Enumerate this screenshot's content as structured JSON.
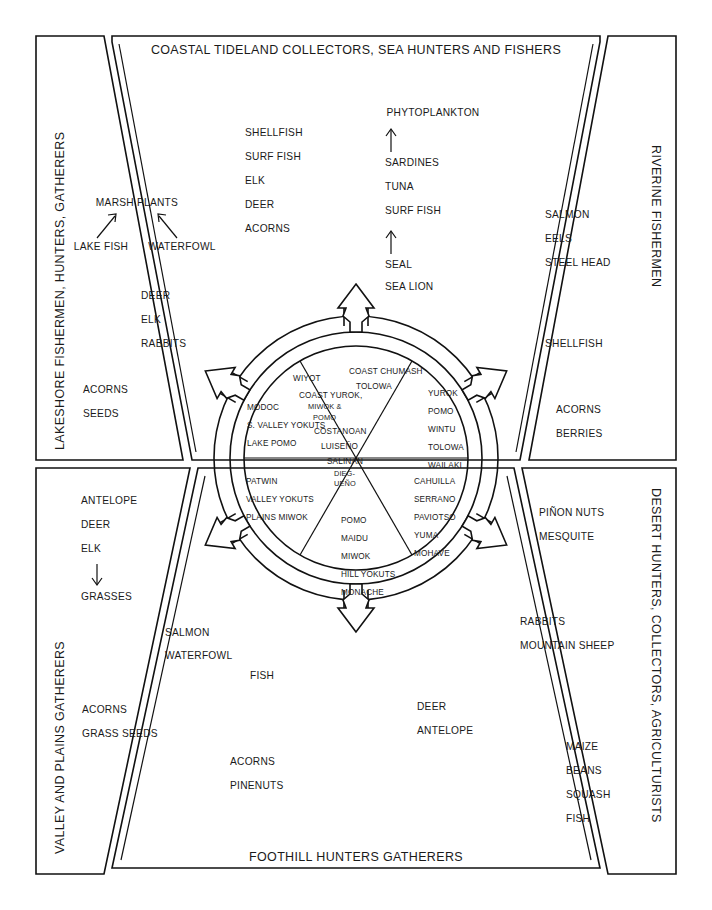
{
  "figure": {
    "ghost_top": "  ",
    "title_top": "COASTAL TIDELAND COLLECTORS, SEA HUNTERS AND  FISHERS",
    "title_bottom": "FOOTHILL HUNTERS  GATHERERS",
    "title_left_top": "LAKESHORE FISHERMEN, HUNTERS, GATHERERS",
    "title_right_top": "RIVERINE FISHERMEN",
    "title_left_bottom": "VALLEY AND PLAINS GATHERERS",
    "title_right_bottom": "DESERT HUNTERS, COLLECTORS, AGRICULTURISTS"
  },
  "resources": {
    "coastal_left_column": [
      "SHELLFISH",
      "SURF FISH",
      "ELK",
      "DEER",
      "ACORNS"
    ],
    "coastal_food_chain": {
      "top": "PHYTOPLANKTON",
      "arrow_up_1": "↑",
      "middle": [
        "SARDINES",
        "TUNA",
        "SURF FISH"
      ],
      "arrow_up_2": "↑",
      "bottom": [
        "SEAL",
        "SEA LION"
      ]
    },
    "lakeshore_chain": {
      "top": "MARSH PLANTS",
      "arrow_left": "↗",
      "arrow_right": "↖",
      "left_source": "LAKE FISH",
      "right_source": "WATERFOWL"
    },
    "lakeshore_game": [
      "DEER",
      "ELK",
      "RABBITS"
    ],
    "lakeshore_plants": [
      "ACORNS",
      "SEEDS"
    ],
    "riverine_fish": [
      "SALMON",
      "EELS",
      "STEEL HEAD"
    ],
    "riverine_shell": [
      "SHELLFISH"
    ],
    "riverine_plants": [
      "ACORNS",
      "BERRIES"
    ],
    "valley_game": [
      "ANTELOPE",
      "DEER",
      "ELK"
    ],
    "valley_arrow_down": "↓",
    "valley_grass": [
      "GRASSES"
    ],
    "valley_water": [
      "SALMON",
      "WATERFOWL"
    ],
    "valley_plants": [
      "ACORNS",
      "GRASS SEEDS"
    ],
    "foothill_fish": [
      "FISH"
    ],
    "foothill_plants": [
      "ACORNS",
      "PINENUTS"
    ],
    "foothill_game": [
      "DEER",
      "ANTELOPE"
    ],
    "desert_plants": [
      "PIÑON NUTS",
      "MESQUITE"
    ],
    "desert_game": [
      "RABBITS",
      "MOUNTAIN SHEEP"
    ],
    "desert_crops": [
      "MAIZE",
      "BEANS",
      "SQUASH",
      "FISH"
    ]
  },
  "wheel": {
    "sectors": [
      {
        "id": "north-northwest",
        "position": "upper-left",
        "tribes": [
          "WIYOT",
          "COAST YUROK,",
          "MIWOK &",
          "POMO",
          "COSTANOAN",
          "LUISEÑO",
          "SALINAN",
          "DIEG-",
          "UEÑO"
        ]
      },
      {
        "id": "north",
        "position": "top",
        "tribes": [
          "COAST CHUMASH",
          "TOLOWA"
        ]
      },
      {
        "id": "northeast",
        "position": "upper-right",
        "tribes": [
          "YUROK",
          "POMO",
          "WINTU",
          "TOLOWA",
          "WAILAKI"
        ]
      },
      {
        "id": "west",
        "position": "left",
        "tribes": [
          "MODOC",
          "S. VALLEY YOKUTS",
          "LAKE POMO"
        ]
      },
      {
        "id": "southwest",
        "position": "lower-left",
        "tribes": [
          "PATWIN",
          "VALLEY YOKUTS",
          "PLAINS MIWOK"
        ]
      },
      {
        "id": "south",
        "position": "bottom",
        "tribes": [
          "POMO",
          "MAIDU",
          "MIWOK",
          "HILL YOKUTS",
          "MONACHE"
        ]
      },
      {
        "id": "southeast",
        "position": "lower-right",
        "tribes": [
          "CAHUILLA",
          "SERRANO",
          "PAVIOTSO",
          "YUMA",
          "MOHAVE"
        ]
      }
    ],
    "arrow_count": 6
  },
  "colors": {
    "ink": "#111111",
    "paper": "#ffffff"
  }
}
